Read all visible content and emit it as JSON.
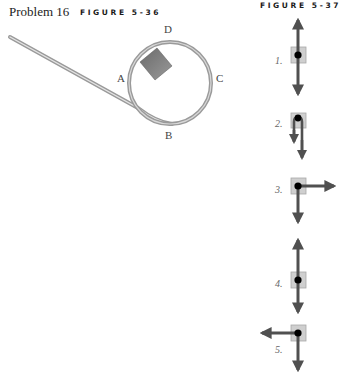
{
  "header": {
    "problem": "Problem 16",
    "figure_left": "FIGURE 5-36",
    "figure_right": "FIGURE 5-37"
  },
  "figure_5_36": {
    "description": "Block on loop-the-loop track entering from inclined ramp",
    "points": {
      "A": "A",
      "B": "B",
      "C": "C",
      "D": "D"
    },
    "colors": {
      "track": "#a8a8a8",
      "block": "#7a7a7a"
    }
  },
  "figure_5_37": {
    "options": [
      {
        "label": "1.",
        "arrows": [
          "up",
          "down"
        ]
      },
      {
        "label": "2.",
        "arrows": [
          "down-short",
          "down-long"
        ]
      },
      {
        "label": "3.",
        "arrows": [
          "right",
          "down"
        ]
      },
      {
        "label": "4.",
        "arrows": [
          "up",
          "down"
        ]
      },
      {
        "label": "5.",
        "arrows": [
          "left",
          "down"
        ]
      }
    ],
    "colors": {
      "arrow": "#505050",
      "box_fill": "#cfcfcf",
      "box_stroke": "#a0a0a0",
      "dot": "#000000"
    }
  }
}
